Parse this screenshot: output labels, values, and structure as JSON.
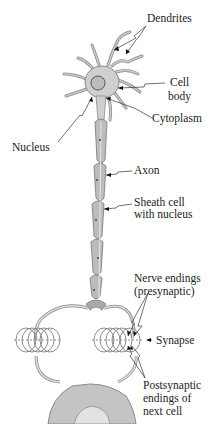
{
  "diagram": {
    "colors": {
      "cell": "#c9c9c9",
      "cell_stroke": "#888888",
      "sheath": "#b8b8b8",
      "line": "#333333",
      "background": "#ffffff"
    },
    "labels": {
      "dendrites": "Dendrites",
      "cell_body_1": "Cell",
      "cell_body_2": "body",
      "cytoplasm": "Cytoplasm",
      "nucleus": "Nucleus",
      "axon": "Axon",
      "sheath_1": "Sheath cell",
      "sheath_2": "with nucleus",
      "nerve_endings_1": "Nerve endings",
      "nerve_endings_2": "(presynaptic)",
      "synapse": "Synapse",
      "postsynaptic_1": "Postsynaptic",
      "postsynaptic_2": "endings of",
      "postsynaptic_3": "next cell"
    }
  }
}
